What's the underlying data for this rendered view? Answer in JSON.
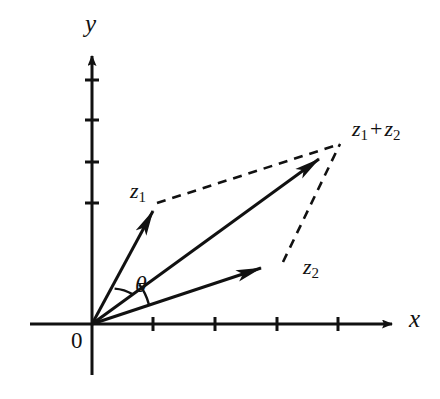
{
  "figure": {
    "background_color": "#ffffff",
    "stroke_color": "#111111"
  },
  "axes": {
    "x_axis": {
      "label": "x",
      "icon": "arrow-right-icon",
      "start_px": [
        30,
        324
      ],
      "end_px": [
        398,
        324
      ],
      "tick_positions_px": [
        153,
        215,
        277,
        338
      ]
    },
    "y_axis": {
      "label": "y",
      "icon": "arrow-up-icon",
      "start_px": [
        92,
        375
      ],
      "end_px": [
        92,
        48
      ],
      "tick_positions_px": [
        203,
        162,
        120,
        80
      ]
    },
    "origin": {
      "label": "0",
      "position_px": [
        92,
        324
      ]
    }
  },
  "vectors": [
    {
      "name": "z1",
      "label": "z",
      "subscript": "1",
      "from_px": [
        92,
        324
      ],
      "to_px": [
        157,
        203
      ],
      "style": "solid",
      "arrowhead": "filled"
    },
    {
      "name": "z2",
      "label": "z",
      "subscript": "2",
      "from_px": [
        92,
        324
      ],
      "to_px": [
        283,
        262
      ],
      "style": "solid",
      "arrowhead": "filled"
    },
    {
      "name": "z1_plus_z2",
      "label": "z",
      "subscript": "1",
      "operator": "+",
      "label2": "z",
      "subscript2": "2",
      "from_px": [
        92,
        324
      ],
      "to_px": [
        340,
        144
      ],
      "style": "solid",
      "arrowhead": "filled"
    }
  ],
  "construction_lines": [
    {
      "name": "dashed-from-z1-tip",
      "from_px": [
        157,
        203
      ],
      "to_px": [
        340,
        144
      ],
      "style": "dashed"
    },
    {
      "name": "dashed-from-z2-tip",
      "from_px": [
        283,
        262
      ],
      "to_px": [
        340,
        144
      ],
      "style": "dashed"
    }
  ],
  "angle": {
    "label": "θ",
    "name": "theta",
    "description": "angle of the resultant vector z1 + z2 measured from the positive x-axis",
    "arcs": [
      {
        "name": "arc-z1-to-resultant",
        "radius_px": 42
      },
      {
        "name": "arc-resultant-to-x-axis",
        "radius_px": 58
      }
    ]
  }
}
